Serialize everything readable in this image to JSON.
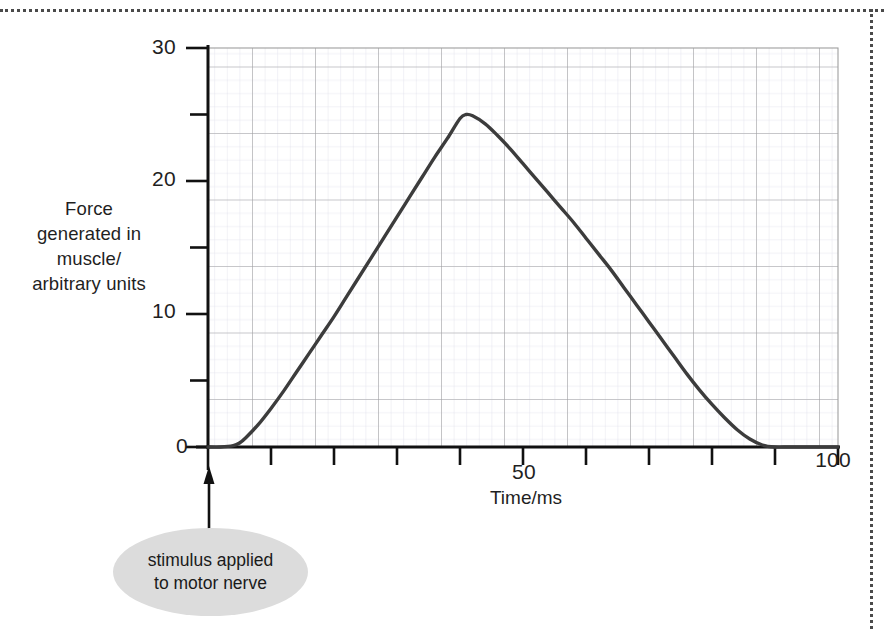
{
  "figure": {
    "y_axis_caption": "Force\ngenerated in\nmuscle/\narbitrary units",
    "y_axis_caption_lines": [
      "Force",
      "generated in",
      "muscle/",
      "arbitrary units"
    ],
    "x_axis_caption": "Time/ms",
    "callout": {
      "line1": "stimulus applied",
      "line2": "to motor nerve",
      "fill_color": "#dcdcdc"
    },
    "arrow": {
      "name": "stimulus-arrow",
      "direction": "up",
      "points_to": "time-zero-on-x-axis"
    },
    "border_color": "#4a4a4a"
  },
  "chart_data": {
    "type": "line",
    "title": "",
    "subtitle": "",
    "xlabel": "Time/ms",
    "ylabel": "Force generated in muscle/ arbitrary units",
    "xlim": [
      0,
      100
    ],
    "ylim": [
      0,
      30
    ],
    "x_ticks": [
      0,
      10,
      20,
      30,
      40,
      50,
      60,
      70,
      80,
      90,
      100
    ],
    "x_tick_labels": [
      "0",
      "",
      "",
      "",
      "",
      "50",
      "",
      "",
      "",
      "",
      "100"
    ],
    "y_ticks": [
      0,
      5,
      10,
      15,
      20,
      25,
      30
    ],
    "y_tick_labels": [
      "0",
      "",
      "10",
      "",
      "20",
      "",
      "30"
    ],
    "grid": true,
    "grid_major_x_step": 10,
    "grid_major_y_step": 5,
    "grid_minor": true,
    "legend": false,
    "line_color": "#3c3c3c",
    "grid_major_color": "#9a9a9a",
    "grid_minor_color": "#d8d8e4",
    "axis_color": "#111111",
    "annotations": [
      {
        "text": "stimulus applied to motor nerve",
        "x": 0,
        "y": 0
      }
    ],
    "series": [
      {
        "name": "Force generated in muscle",
        "x": [
          0,
          2,
          4,
          5,
          6,
          8,
          10,
          12,
          14,
          16,
          18,
          20,
          22,
          24,
          26,
          28,
          30,
          32,
          34,
          36,
          38,
          40,
          41,
          42,
          44,
          46,
          48,
          50,
          52,
          54,
          56,
          58,
          60,
          62,
          64,
          66,
          68,
          70,
          72,
          74,
          76,
          78,
          80,
          82,
          84,
          86,
          88,
          90,
          92,
          94,
          96,
          98,
          100
        ],
        "y": [
          0,
          0,
          0.1,
          0.3,
          0.7,
          1.7,
          2.9,
          4.2,
          5.6,
          7.0,
          8.4,
          9.8,
          11.3,
          12.8,
          14.3,
          15.8,
          17.3,
          18.8,
          20.3,
          21.8,
          23.2,
          24.7,
          25.0,
          24.9,
          24.3,
          23.4,
          22.4,
          21.3,
          20.2,
          19.1,
          18.0,
          16.9,
          15.7,
          14.5,
          13.3,
          12.0,
          10.7,
          9.4,
          8.1,
          6.8,
          5.5,
          4.3,
          3.2,
          2.2,
          1.3,
          0.6,
          0.15,
          0,
          0,
          0,
          0,
          0,
          0
        ]
      }
    ],
    "peak": {
      "x": 41,
      "y": 25
    },
    "onset": {
      "x": 4
    },
    "return_to_baseline": {
      "x": 88
    }
  }
}
